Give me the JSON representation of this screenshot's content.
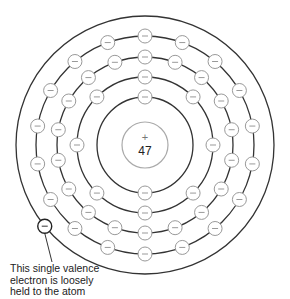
{
  "diagram": {
    "nucleus": {
      "charge_symbol": "+",
      "atomic_number": "47"
    },
    "electron_symbol": "−",
    "shells": [
      {
        "name": "shell-1",
        "electrons": 2
      },
      {
        "name": "shell-2",
        "electrons": 8
      },
      {
        "name": "shell-3",
        "electrons": 18
      },
      {
        "name": "shell-4",
        "electrons": 18
      },
      {
        "name": "shell-5",
        "electrons": 1
      }
    ],
    "caption": {
      "lines": [
        "This single valence",
        "electron is loosely",
        "held to the atom"
      ]
    },
    "colors": {
      "orbit": "#333333",
      "electron_stroke": "#999999",
      "valence_stroke": "#222222",
      "text": "#222222"
    }
  }
}
